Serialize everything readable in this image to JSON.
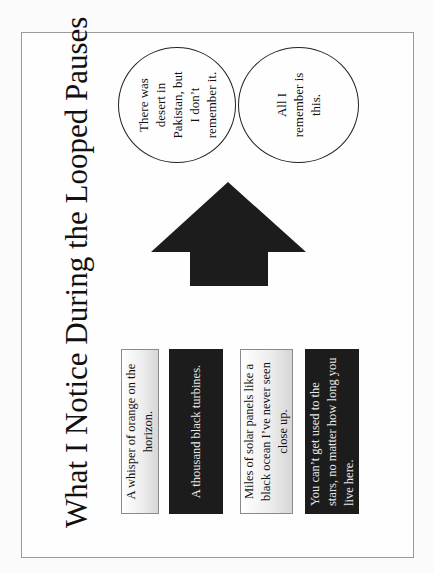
{
  "slide": {
    "title": "What I Notice During the Looped Pauses",
    "orientation": "rotated 90° counter-clockwise",
    "boxes": [
      {
        "text": "A whisper of orange on the horizon.",
        "style": "light"
      },
      {
        "text": "A thousand black turbines.",
        "style": "dark"
      },
      {
        "text": "Miles of solar panels like a black ocean I’ve never seen close up.",
        "style": "light"
      },
      {
        "text": "You can’t get used to the stars, no matter how long you live here.",
        "style": "dark"
      }
    ],
    "arrow": {
      "direction": "toward circles",
      "color": "#1c1c1c"
    },
    "circles": [
      {
        "text": "There was desert in Pakistan, but I don’t remember it."
      },
      {
        "text": "All I remember is this."
      }
    ]
  }
}
